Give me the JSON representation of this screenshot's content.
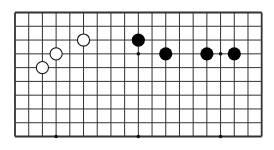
{
  "board": {
    "columns": 19,
    "rows": 10,
    "origin_x": 15,
    "origin_y": 12.5,
    "spacing_x": 13.705,
    "spacing_y": 13.78,
    "line_color": "#333333",
    "border_color": "#222222",
    "background": "#ffffff"
  },
  "star_points": [
    {
      "col": 9,
      "row": 3
    },
    {
      "col": 15,
      "row": 3
    },
    {
      "col": 3,
      "row": 9
    },
    {
      "col": 9,
      "row": 9
    },
    {
      "col": 15,
      "row": 9
    }
  ],
  "stones": [
    {
      "color": "white",
      "col": 2,
      "row": 4
    },
    {
      "color": "white",
      "col": 3,
      "row": 3
    },
    {
      "color": "white",
      "col": 5,
      "row": 2
    },
    {
      "color": "black",
      "col": 9,
      "row": 2
    },
    {
      "color": "black",
      "col": 11,
      "row": 3
    },
    {
      "color": "black",
      "col": 14,
      "row": 3
    },
    {
      "color": "black",
      "col": 16,
      "row": 3
    }
  ],
  "stone_radius": 6.6,
  "colors": {
    "black_stone": "#000000",
    "white_stone_fill": "#ffffff",
    "white_stone_stroke": "#111111"
  }
}
